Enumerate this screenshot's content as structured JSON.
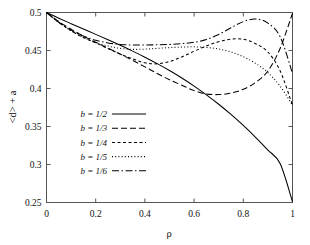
{
  "chart_data": {
    "type": "line",
    "title": "",
    "xlabel": "ρ",
    "ylabel": "<d> + a",
    "xlim": [
      0,
      1
    ],
    "ylim": [
      0.25,
      0.5
    ],
    "xticks": [
      "0",
      "0.2",
      "0.4",
      "0.6",
      "0.8",
      "1"
    ],
    "xtick_values": [
      0,
      0.2,
      0.4,
      0.6,
      0.8,
      1
    ],
    "yticks": [
      "0.25",
      "0.3",
      "0.35",
      "0.4",
      "0.45",
      "0.5"
    ],
    "ytick_values": [
      0.25,
      0.3,
      0.35,
      0.4,
      0.45,
      0.5
    ],
    "grid": false,
    "legend_position": "center-left",
    "x": [
      0,
      0.05,
      0.1,
      0.15,
      0.2,
      0.25,
      0.3,
      0.35,
      0.4,
      0.45,
      0.5,
      0.55,
      0.6,
      0.65,
      0.7,
      0.75,
      0.8,
      0.85,
      0.9,
      0.95,
      1
    ],
    "series": [
      {
        "name": "b = 1/2",
        "label": "b = 1/2",
        "style": "solid",
        "dash": "none",
        "color": "#000000",
        "values": [
          0.5,
          0.4925,
          0.4853,
          0.4782,
          0.4712,
          0.4641,
          0.4568,
          0.4492,
          0.4412,
          0.4327,
          0.4236,
          0.4138,
          0.4032,
          0.3917,
          0.3793,
          0.3659,
          0.3514,
          0.3358,
          0.319,
          0.301,
          0.251
        ]
      },
      {
        "name": "b = 1/3",
        "label": "b = 1/3",
        "style": "dashed",
        "dash": "6,3",
        "color": "#000000",
        "values": [
          0.5,
          0.488,
          0.478,
          0.469,
          0.4608,
          0.453,
          0.4452,
          0.437,
          0.4285,
          0.4198,
          0.4115,
          0.4043,
          0.3972,
          0.3928,
          0.392,
          0.394,
          0.399,
          0.408,
          0.423,
          0.453,
          0.499
        ]
      },
      {
        "name": "b = 1/4",
        "label": "b = 1/4",
        "style": "short-dashed",
        "dash": "3,2.5",
        "color": "#000000",
        "values": [
          0.5,
          0.487,
          0.476,
          0.467,
          0.46,
          0.4525,
          0.4452,
          0.439,
          0.4338,
          0.4325,
          0.4355,
          0.4415,
          0.449,
          0.456,
          0.4615,
          0.465,
          0.4648,
          0.459,
          0.448,
          0.423,
          0.378
        ]
      },
      {
        "name": "b = 1/5",
        "label": "b = 1/5",
        "style": "dotted",
        "dash": "1,2.2",
        "color": "#000000",
        "values": [
          0.5,
          0.487,
          0.476,
          0.4672,
          0.4605,
          0.4558,
          0.4528,
          0.4515,
          0.4518,
          0.4528,
          0.4538,
          0.4545,
          0.4548,
          0.454,
          0.452,
          0.448,
          0.4418,
          0.433,
          0.421,
          0.403,
          0.378
        ]
      },
      {
        "name": "b = 1/6",
        "label": "b = 1/6",
        "style": "dash-dot",
        "dash": "7,2.5,1.5,2.5",
        "color": "#000000",
        "values": [
          0.5,
          0.4872,
          0.4768,
          0.469,
          0.4635,
          0.46,
          0.458,
          0.4572,
          0.4572,
          0.4575,
          0.458,
          0.459,
          0.4608,
          0.4645,
          0.471,
          0.48,
          0.488,
          0.4915,
          0.486,
          0.468,
          0.42
        ]
      }
    ]
  },
  "legend": {
    "items": [
      {
        "label": "b = 1/2",
        "style": "solid"
      },
      {
        "label": "b = 1/3",
        "style": "dashed"
      },
      {
        "label": "b = 1/4",
        "style": "short-dashed"
      },
      {
        "label": "b = 1/5",
        "style": "dotted"
      },
      {
        "label": "b = 1/6",
        "style": "dash-dot"
      }
    ]
  },
  "axes": {
    "x_title": "ρ",
    "y_title": "<d> + a",
    "frame_color": "#555555"
  }
}
